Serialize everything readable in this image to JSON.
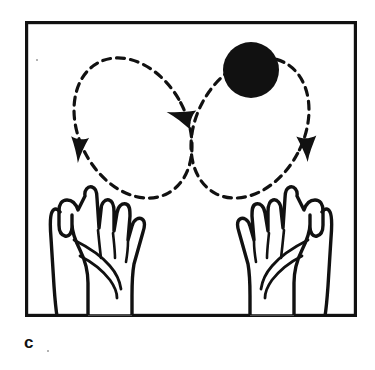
{
  "figure": {
    "caption": "c",
    "background_color": "#ffffff",
    "ink_color": "#111111",
    "frame": {
      "name": "panel-border",
      "x": 25,
      "y": 21,
      "width": 332,
      "height": 296,
      "stroke_width": 3.2,
      "color": "#111111"
    },
    "ball": {
      "label": "juggling-ball",
      "cx": 251,
      "cy": 70,
      "r": 28,
      "fill": "#111111"
    },
    "path": {
      "label": "figure-eight-trajectory",
      "style": "dashed",
      "dash_length": 8,
      "dash_gap": 6,
      "stroke_width": 3.2,
      "color": "#111111",
      "crossing_point": {
        "x": 190,
        "y": 99
      },
      "left_loop": {
        "cx": 133,
        "cy": 128,
        "rx": 54,
        "ry": 74,
        "rotation_deg": -28
      },
      "right_loop": {
        "cx": 250,
        "cy": 128,
        "rx": 54,
        "ry": 74,
        "rotation_deg": 28
      }
    },
    "arrows": [
      {
        "label": "arrow-left-descending",
        "x": 79,
        "y": 150,
        "rotation_deg": 95,
        "size": 14
      },
      {
        "label": "arrow-center-toward-left",
        "x": 180,
        "y": 116,
        "rotation_deg": 200,
        "size": 15
      },
      {
        "label": "arrow-right-descending",
        "x": 307,
        "y": 149,
        "rotation_deg": 85,
        "size": 14
      }
    ],
    "hands": [
      {
        "label": "left-hand-open-palm",
        "side": "left"
      },
      {
        "label": "right-hand-open-palm",
        "side": "right"
      }
    ],
    "specks": [
      {
        "x": 36,
        "y": 59,
        "size": 2
      },
      {
        "x": 47,
        "y": 350,
        "size": 2
      }
    ]
  }
}
